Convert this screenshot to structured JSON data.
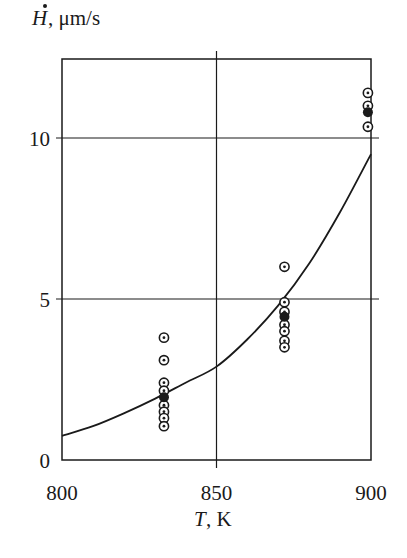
{
  "chart_data": {
    "type": "scatter",
    "title": "",
    "xlabel": "T, K",
    "xlabel_var": "T",
    "xlabel_unit": ", K",
    "ylabel": "Ḣ, μm/s",
    "ylabel_var": "H",
    "ylabel_unit": ", μm/s",
    "xlim": [
      800,
      900
    ],
    "ylim": [
      0,
      12.45
    ],
    "xticks": [
      800,
      850,
      900
    ],
    "xtick_labels": [
      "800",
      "850",
      "900"
    ],
    "yticks": [
      0,
      5,
      10
    ],
    "ytick_labels": [
      "0",
      "5",
      "10"
    ],
    "grid": {
      "x": [
        850
      ],
      "y": [
        5,
        10
      ]
    },
    "legend": null,
    "series": [
      {
        "name": "measured (open circles)",
        "marker": "circle-dot",
        "points": [
          {
            "x": 833,
            "y": 3.8
          },
          {
            "x": 833,
            "y": 3.1
          },
          {
            "x": 833,
            "y": 2.4
          },
          {
            "x": 833,
            "y": 2.15
          },
          {
            "x": 833,
            "y": 1.7
          },
          {
            "x": 833,
            "y": 1.5
          },
          {
            "x": 833,
            "y": 1.3
          },
          {
            "x": 833,
            "y": 1.05
          },
          {
            "x": 872,
            "y": 6.0
          },
          {
            "x": 872,
            "y": 4.9
          },
          {
            "x": 872,
            "y": 4.6
          },
          {
            "x": 872,
            "y": 4.2
          },
          {
            "x": 872,
            "y": 4.0
          },
          {
            "x": 872,
            "y": 3.7
          },
          {
            "x": 872,
            "y": 3.5
          },
          {
            "x": 899,
            "y": 11.4
          },
          {
            "x": 899,
            "y": 11.0
          },
          {
            "x": 899,
            "y": 10.35
          }
        ]
      },
      {
        "name": "mean (filled circles)",
        "marker": "filled-circle",
        "points": [
          {
            "x": 833,
            "y": 1.95
          },
          {
            "x": 872,
            "y": 4.45
          },
          {
            "x": 899,
            "y": 10.8
          }
        ]
      },
      {
        "name": "fit curve",
        "marker": "line",
        "points": [
          {
            "x": 800,
            "y": 0.75
          },
          {
            "x": 810,
            "y": 1.05
          },
          {
            "x": 820,
            "y": 1.45
          },
          {
            "x": 830,
            "y": 1.9
          },
          {
            "x": 840,
            "y": 2.4
          },
          {
            "x": 850,
            "y": 2.9
          },
          {
            "x": 860,
            "y": 3.75
          },
          {
            "x": 870,
            "y": 4.8
          },
          {
            "x": 880,
            "y": 6.1
          },
          {
            "x": 890,
            "y": 7.7
          },
          {
            "x": 900,
            "y": 9.5
          }
        ]
      }
    ]
  },
  "colors": {
    "ink": "#1a1a1a",
    "background": "#ffffff"
  }
}
